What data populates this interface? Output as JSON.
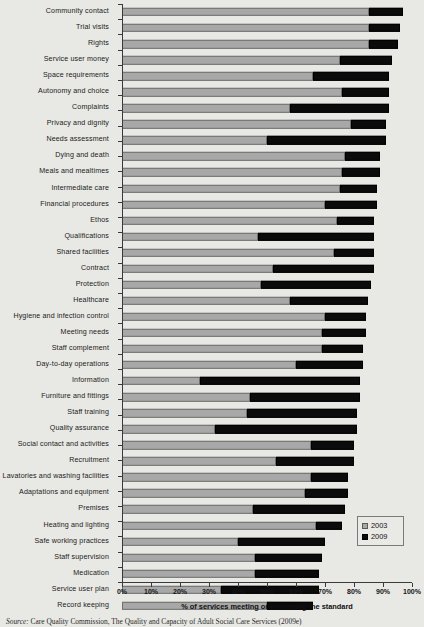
{
  "chart_data": {
    "type": "bar",
    "orientation": "horizontal",
    "stacked": false,
    "grouped_overlay": true,
    "title": "",
    "xlabel": "% of services meeting or exceeding the standard",
    "ylabel": "",
    "xlim": [
      0,
      100
    ],
    "xticks": [
      "0%",
      "10%",
      "20%",
      "30%",
      "40%",
      "50%",
      "60%",
      "70%",
      "80%",
      "90%",
      "100%"
    ],
    "xtick_values": [
      0,
      10,
      20,
      30,
      40,
      50,
      60,
      70,
      80,
      90,
      100
    ],
    "grid": false,
    "legend_position": "bottom-right",
    "series": [
      {
        "name": "2003",
        "color": "#a8a8a8"
      },
      {
        "name": "2009",
        "color": "#0b0b0b"
      }
    ],
    "categories": [
      "Community contact",
      "Trial visits",
      "Rights",
      "Service user money",
      "Space requirements",
      "Autonomy and choice",
      "Complaints",
      "Privacy and dignity",
      "Needs assessment",
      "Dying and death",
      "Meals and mealtimes",
      "Intermediate care",
      "Financial procedures",
      "Ethos",
      "Qualifications",
      "Shared facilities",
      "Contract",
      "Protection",
      "Healthcare",
      "Hygiene and infection control",
      "Meeting needs",
      "Staff complement",
      "Day-to-day operations",
      "Information",
      "Furniture and fittings",
      "Staff training",
      "Quality assurance",
      "Social contact and activities",
      "Recruitment",
      "Lavatories and washing facilities",
      "Adaptations and equipment",
      "Premises",
      "Heating and lighting",
      "Safe working practices",
      "Staff supervision",
      "Medication",
      "Service user plan",
      "Record keeping"
    ],
    "rows": [
      {
        "category": "Community contact",
        "v2003": 85,
        "v2009": 97
      },
      {
        "category": "Trial visits",
        "v2003": 85,
        "v2009": 96
      },
      {
        "category": "Rights",
        "v2003": 85,
        "v2009": 95
      },
      {
        "category": "Service user money",
        "v2003": 75,
        "v2009": 93
      },
      {
        "category": "Space requirements",
        "v2003": 66,
        "v2009": 92
      },
      {
        "category": "Autonomy and choice",
        "v2003": 76,
        "v2009": 92
      },
      {
        "category": "Complaints",
        "v2003": 58,
        "v2009": 92
      },
      {
        "category": "Privacy and dignity",
        "v2003": 79,
        "v2009": 91
      },
      {
        "category": "Needs assessment",
        "v2003": 50,
        "v2009": 91
      },
      {
        "category": "Dying and death",
        "v2003": 77,
        "v2009": 89
      },
      {
        "category": "Meals and mealtimes",
        "v2003": 76,
        "v2009": 89
      },
      {
        "category": "Intermediate care",
        "v2003": 75,
        "v2009": 88
      },
      {
        "category": "Financial procedures",
        "v2003": 70,
        "v2009": 88
      },
      {
        "category": "Ethos",
        "v2003": 74,
        "v2009": 87
      },
      {
        "category": "Qualifications",
        "v2003": 47,
        "v2009": 87
      },
      {
        "category": "Shared facilities",
        "v2003": 73,
        "v2009": 87
      },
      {
        "category": "Contract",
        "v2003": 52,
        "v2009": 87
      },
      {
        "category": "Protection",
        "v2003": 48,
        "v2009": 86
      },
      {
        "category": "Healthcare",
        "v2003": 58,
        "v2009": 85
      },
      {
        "category": "Hygiene and infection control",
        "v2003": 70,
        "v2009": 84
      },
      {
        "category": "Meeting needs",
        "v2003": 69,
        "v2009": 84
      },
      {
        "category": "Staff complement",
        "v2003": 69,
        "v2009": 83
      },
      {
        "category": "Day-to-day operations",
        "v2003": 60,
        "v2009": 83
      },
      {
        "category": "Information",
        "v2003": 27,
        "v2009": 82
      },
      {
        "category": "Furniture and fittings",
        "v2003": 44,
        "v2009": 82
      },
      {
        "category": "Staff training",
        "v2003": 43,
        "v2009": 81
      },
      {
        "category": "Quality assurance",
        "v2003": 32,
        "v2009": 81
      },
      {
        "category": "Social contact and activities",
        "v2003": 65,
        "v2009": 80
      },
      {
        "category": "Recruitment",
        "v2003": 53,
        "v2009": 80
      },
      {
        "category": "Lavatories and washing facilities",
        "v2003": 65,
        "v2009": 78
      },
      {
        "category": "Adaptations and equipment",
        "v2003": 63,
        "v2009": 78
      },
      {
        "category": "Premises",
        "v2003": 45,
        "v2009": 77
      },
      {
        "category": "Heating and lighting",
        "v2003": 67,
        "v2009": 76
      },
      {
        "category": "Safe working practices",
        "v2003": 40,
        "v2009": 70
      },
      {
        "category": "Staff supervision",
        "v2003": 46,
        "v2009": 69
      },
      {
        "category": "Medication",
        "v2003": 46,
        "v2009": 68
      },
      {
        "category": "Service user plan",
        "v2003": 34,
        "v2009": 68
      },
      {
        "category": "Record keeping",
        "v2003": 50,
        "v2009": 66
      }
    ]
  },
  "legend": {
    "items": [
      {
        "label": "2003",
        "color": "#a8a8a8"
      },
      {
        "label": "2009",
        "color": "#0b0b0b"
      }
    ]
  },
  "axis": {
    "x_title": "% of services meeting or exceeding the standard"
  },
  "source": {
    "prefix": "Source:",
    "text": "Care Quality Commission, The Quality and Capacity of Adult Social Care Services (2009e)"
  }
}
